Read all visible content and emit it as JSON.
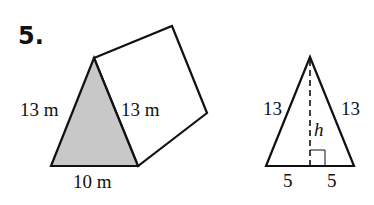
{
  "problem": {
    "number": "5."
  },
  "prism": {
    "labels": {
      "left_side": "13 m",
      "right_side": "13 m",
      "base": "10 m"
    },
    "colors": {
      "front_face": "#c8c8c8",
      "stroke": "#111111"
    }
  },
  "triangle": {
    "labels": {
      "left_side": "13",
      "right_side": "13",
      "height": "h",
      "base_left": "5",
      "base_right": "5"
    }
  }
}
